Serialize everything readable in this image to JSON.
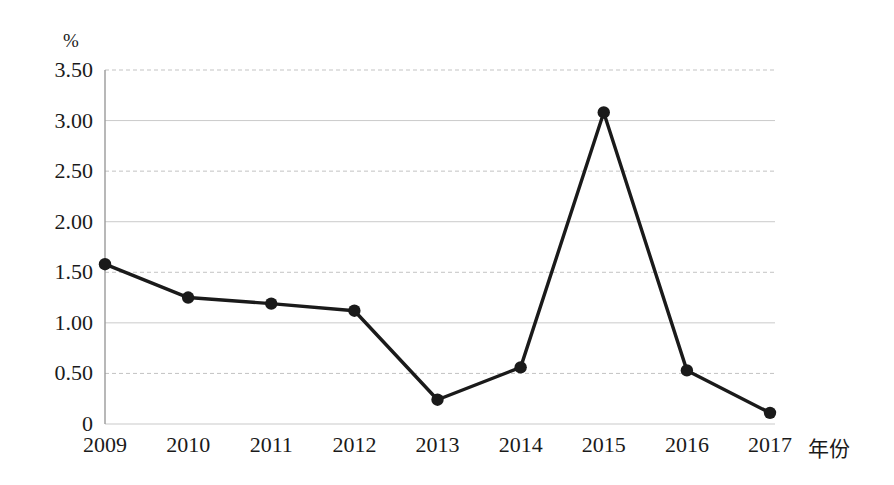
{
  "chart_data": {
    "type": "line",
    "title": "",
    "xlabel": "年份",
    "ylabel": "%",
    "x": [
      "2009",
      "2010",
      "2011",
      "2012",
      "2013",
      "2014",
      "2015",
      "2016",
      "2017"
    ],
    "categories": [
      "2009",
      "2010",
      "2011",
      "2012",
      "2013",
      "2014",
      "2015",
      "2016",
      "2017"
    ],
    "values": [
      1.58,
      1.25,
      1.19,
      1.12,
      0.24,
      0.56,
      3.08,
      0.53,
      0.11
    ],
    "series": [
      {
        "name": "",
        "values": [
          1.58,
          1.25,
          1.19,
          1.12,
          0.24,
          0.56,
          3.08,
          0.53,
          0.11
        ]
      }
    ],
    "ylim": [
      0,
      3.5
    ],
    "yticks": [
      0,
      0.5,
      1.0,
      1.5,
      2.0,
      2.5,
      3.0,
      3.5
    ],
    "ytick_labels": [
      "0",
      "0.50",
      "1.00",
      "1.50",
      "2.00",
      "2.50",
      "3.00",
      "3.50"
    ],
    "xtick_labels": [
      "2009",
      "2010",
      "2011",
      "2012",
      "2013",
      "2014",
      "2015",
      "2016",
      "2017"
    ],
    "grid": true,
    "grid_axis": "y",
    "legend": "none",
    "marker": "filled-circle",
    "line_color": "#1a1a1a",
    "marker_color": "#1a1a1a",
    "grid_color": "#b9b9b9",
    "axis_color": "#9a9a9a",
    "background_color": "#ffffff"
  }
}
